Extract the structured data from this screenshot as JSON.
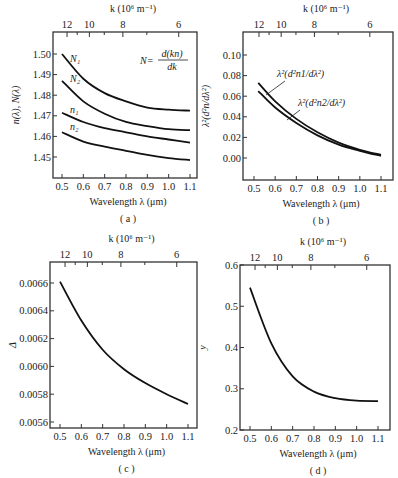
{
  "figure": {
    "panels": [
      "a",
      "b",
      "c",
      "d"
    ]
  },
  "chart_data": [
    {
      "id": "a",
      "type": "line",
      "caption": "( a )",
      "title": "",
      "xlabel": "Wavelength λ (μm)",
      "ylabel": "n(λ), N(λ)",
      "top_axis_label": "k (10⁶ m⁻¹)",
      "top_ticks": [
        "12",
        "10",
        "8",
        "6"
      ],
      "x_ticks": [
        "0.5",
        "0.6",
        "0.7",
        "0.8",
        "0.9",
        "1.0",
        "1.1"
      ],
      "y_ticks": [
        "1.45",
        "1.46",
        "1.47",
        "1.48",
        "1.49",
        "1.50"
      ],
      "xlim": [
        0.45,
        1.15
      ],
      "ylim": [
        1.44,
        1.51
      ],
      "annotation": "N = d(kn)/dk",
      "x": [
        0.5,
        0.6,
        0.7,
        0.8,
        0.9,
        1.0,
        1.1
      ],
      "series": [
        {
          "name": "N1",
          "values": [
            1.5,
            1.488,
            1.481,
            1.477,
            1.474,
            1.473,
            1.4725
          ]
        },
        {
          "name": "N2",
          "values": [
            1.487,
            1.477,
            1.471,
            1.467,
            1.465,
            1.4635,
            1.463
          ]
        },
        {
          "name": "n1",
          "values": [
            1.4715,
            1.467,
            1.464,
            1.462,
            1.46,
            1.4585,
            1.457
          ]
        },
        {
          "name": "n2",
          "values": [
            1.462,
            1.4575,
            1.455,
            1.453,
            1.451,
            1.4495,
            1.4485
          ]
        }
      ]
    },
    {
      "id": "b",
      "type": "line",
      "caption": "( b )",
      "title": "",
      "xlabel": "Wavelength λ (μm)",
      "ylabel": "λ²(d²n/dλ²)",
      "top_axis_label": "k (10⁶ m⁻¹)",
      "top_ticks": [
        "12",
        "10",
        "8",
        "6"
      ],
      "x_ticks": [
        "0.5",
        "0.6",
        "0.7",
        "0.8",
        "0.9",
        "1.0",
        "1.1"
      ],
      "y_ticks": [
        "0.00",
        "0.02",
        "0.04",
        "0.06",
        "0.08",
        "0.10"
      ],
      "xlim": [
        0.45,
        1.15
      ],
      "ylim": [
        -0.02,
        0.12
      ],
      "x": [
        0.52,
        0.6,
        0.7,
        0.8,
        0.9,
        1.0,
        1.1
      ],
      "series": [
        {
          "name": "λ²(d²n1/dλ²)",
          "values": [
            0.073,
            0.055,
            0.038,
            0.025,
            0.015,
            0.008,
            0.003
          ]
        },
        {
          "name": "λ²(d²n2/dλ²)",
          "values": [
            0.065,
            0.049,
            0.034,
            0.022,
            0.013,
            0.007,
            0.002
          ]
        }
      ]
    },
    {
      "id": "c",
      "type": "line",
      "caption": "( c )",
      "title": "",
      "xlabel": "Wavelength λ (μm)",
      "ylabel": "Δ",
      "top_axis_label": "k (10⁶ m⁻¹)",
      "top_ticks": [
        "12",
        "10",
        "8",
        "6"
      ],
      "x_ticks": [
        "0.5",
        "0.6",
        "0.7",
        "0.8",
        "0.9",
        "1.0",
        "1.1"
      ],
      "y_ticks": [
        "0.0056",
        "0.0058",
        "0.0060",
        "0.0062",
        "0.0064",
        "0.0066"
      ],
      "xlim": [
        0.45,
        1.15
      ],
      "ylim": [
        0.00557,
        0.0067
      ],
      "x": [
        0.5,
        0.6,
        0.7,
        0.8,
        0.9,
        1.0,
        1.1
      ],
      "series": [
        {
          "name": "Δ",
          "values": [
            0.00661,
            0.00633,
            0.00612,
            0.00598,
            0.00588,
            0.0058,
            0.00573
          ]
        }
      ]
    },
    {
      "id": "d",
      "type": "line",
      "caption": "( d )",
      "title": "",
      "xlabel": "Wavelength λ (μm)",
      "ylabel": "y",
      "top_axis_label": "k (10⁶ m⁻¹)",
      "top_ticks": [
        "12",
        "10",
        "8",
        "6"
      ],
      "x_ticks": [
        "0.5",
        "0.6",
        "0.7",
        "0.8",
        "0.9",
        "1.0",
        "1.1"
      ],
      "y_ticks": [
        "0.2",
        "0.3",
        "0.4",
        "0.5",
        "0.6"
      ],
      "xlim": [
        0.45,
        1.15
      ],
      "ylim": [
        0.2,
        0.6
      ],
      "x": [
        0.5,
        0.6,
        0.7,
        0.8,
        0.9,
        1.0,
        1.1
      ],
      "series": [
        {
          "name": "y",
          "values": [
            0.545,
            0.41,
            0.33,
            0.293,
            0.277,
            0.271,
            0.27
          ]
        }
      ]
    }
  ]
}
